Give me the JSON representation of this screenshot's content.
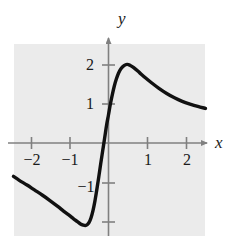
{
  "figure": {
    "title": "",
    "background_color": "#ffffff",
    "plot_background_color": "#ebebeb",
    "curve_color": "#111111",
    "axis_color": "#808080"
  },
  "axes": {
    "x_label": "x",
    "y_label": "y"
  },
  "ticks": {
    "x": [
      {
        "value": -2,
        "label": "−2"
      },
      {
        "value": -1,
        "label": "−1"
      },
      {
        "value": 1,
        "label": "1"
      },
      {
        "value": 2,
        "label": "2"
      }
    ],
    "y": [
      {
        "value": 2,
        "label": "2"
      },
      {
        "value": 1,
        "label": "1"
      },
      {
        "value": -1,
        "label": "−1"
      },
      {
        "value": -2,
        "label": ""
      }
    ]
  },
  "chart_data": {
    "type": "line",
    "title": "",
    "xlabel": "x",
    "ylabel": "y",
    "xlim": [
      -2.45,
      2.5
    ],
    "ylim": [
      -2.55,
      2.55
    ],
    "grid": false,
    "legend": null,
    "xticks": [
      -2,
      -1,
      1,
      2
    ],
    "yticks": [
      -1,
      1,
      2
    ],
    "annotations": [
      {
        "text": "local maximum",
        "x": 0.5,
        "y": 2.0
      },
      {
        "text": "local minimum",
        "x": -0.6,
        "y": -2.1
      },
      {
        "text": "x-intercept",
        "x": 0.0,
        "y": 0.0
      }
    ],
    "series": [
      {
        "name": "curve",
        "x": [
          -2.45,
          -2.3,
          -2.1,
          -1.9,
          -1.7,
          -1.5,
          -1.3,
          -1.15,
          -1.0,
          -0.9,
          -0.8,
          -0.72,
          -0.65,
          -0.6,
          -0.55,
          -0.5,
          -0.45,
          -0.4,
          -0.35,
          -0.3,
          -0.25,
          -0.2,
          -0.15,
          -0.1,
          -0.05,
          0.0,
          0.05,
          0.1,
          0.15,
          0.2,
          0.26,
          0.32,
          0.4,
          0.48,
          0.55,
          0.65,
          0.8,
          0.95,
          1.1,
          1.3,
          1.5,
          1.7,
          1.9,
          2.1,
          2.3,
          2.5
        ],
        "y": [
          -0.85,
          -0.95,
          -1.07,
          -1.2,
          -1.33,
          -1.47,
          -1.62,
          -1.74,
          -1.85,
          -1.93,
          -2.0,
          -2.06,
          -2.09,
          -2.1,
          -2.08,
          -2.02,
          -1.9,
          -1.72,
          -1.48,
          -1.18,
          -0.86,
          -0.52,
          -0.2,
          0.12,
          0.45,
          0.72,
          1.0,
          1.24,
          1.45,
          1.62,
          1.78,
          1.89,
          1.97,
          2.0,
          1.98,
          1.92,
          1.79,
          1.66,
          1.54,
          1.39,
          1.26,
          1.15,
          1.06,
          0.99,
          0.93,
          0.88
        ]
      }
    ]
  }
}
